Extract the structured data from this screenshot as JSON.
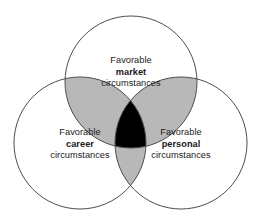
{
  "figure": {
    "type": "venn-diagram-3-set",
    "background_color": "#ffffff",
    "stroke_color": "#4d4d4d",
    "stroke_width": 1,
    "circle_fill": "#ffffff",
    "pair_overlap_color": "#b8b8b8",
    "triple_overlap_color": "#000000",
    "text_color": "#1a1a1a",
    "sets": [
      {
        "id": "market",
        "position": "top",
        "cx": 131,
        "cy": 82,
        "r": 66,
        "line1": "Favorable",
        "line2": "market",
        "line3": "circumstances"
      },
      {
        "id": "career",
        "position": "bottom-left",
        "cx": 80,
        "cy": 143,
        "r": 66,
        "line1": "Favorable",
        "line2": "career",
        "line3": "circumstances"
      },
      {
        "id": "personal",
        "position": "bottom-right",
        "cx": 181,
        "cy": 143,
        "r": 66,
        "line1": "Favorable",
        "line2": "personal",
        "line3": "circumstances"
      }
    ],
    "clipped_caption": ""
  }
}
